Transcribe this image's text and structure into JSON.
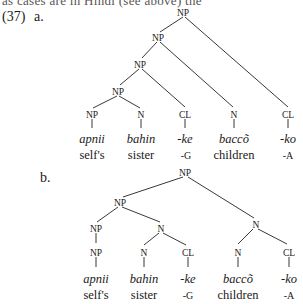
{
  "header": {
    "cut_text": "as cases are in Hindi (see above) the",
    "example_number": "(37)",
    "sub_a": "a.",
    "sub_b": "b."
  },
  "tree_a": {
    "nodes": {
      "root": "NP",
      "np2": "NP",
      "np3": "NP",
      "np4": "NP",
      "leaf1": "NP",
      "leaf2": "N",
      "leaf3": "CL",
      "leaf4": "N",
      "leaf5": "CL"
    },
    "words": [
      "apnii",
      "bahin",
      "-ke",
      "baccõ",
      "-ko"
    ],
    "glosses": [
      "self's",
      "sister",
      "-G",
      "children",
      "-A"
    ]
  },
  "tree_b": {
    "nodes": {
      "root": "NP",
      "np_left": "NP",
      "n_right": "N",
      "np_a": "NP",
      "n_mid": "N",
      "np_leaf": "NP",
      "n_bahin": "N",
      "cl_ke": "CL",
      "n_bacco": "N",
      "cl_ko": "CL"
    },
    "words": [
      "apnii",
      "bahin",
      "-ke",
      "baccõ",
      "-ko"
    ],
    "glosses": [
      "self's",
      "sister",
      "-G",
      "children",
      "-A"
    ]
  }
}
